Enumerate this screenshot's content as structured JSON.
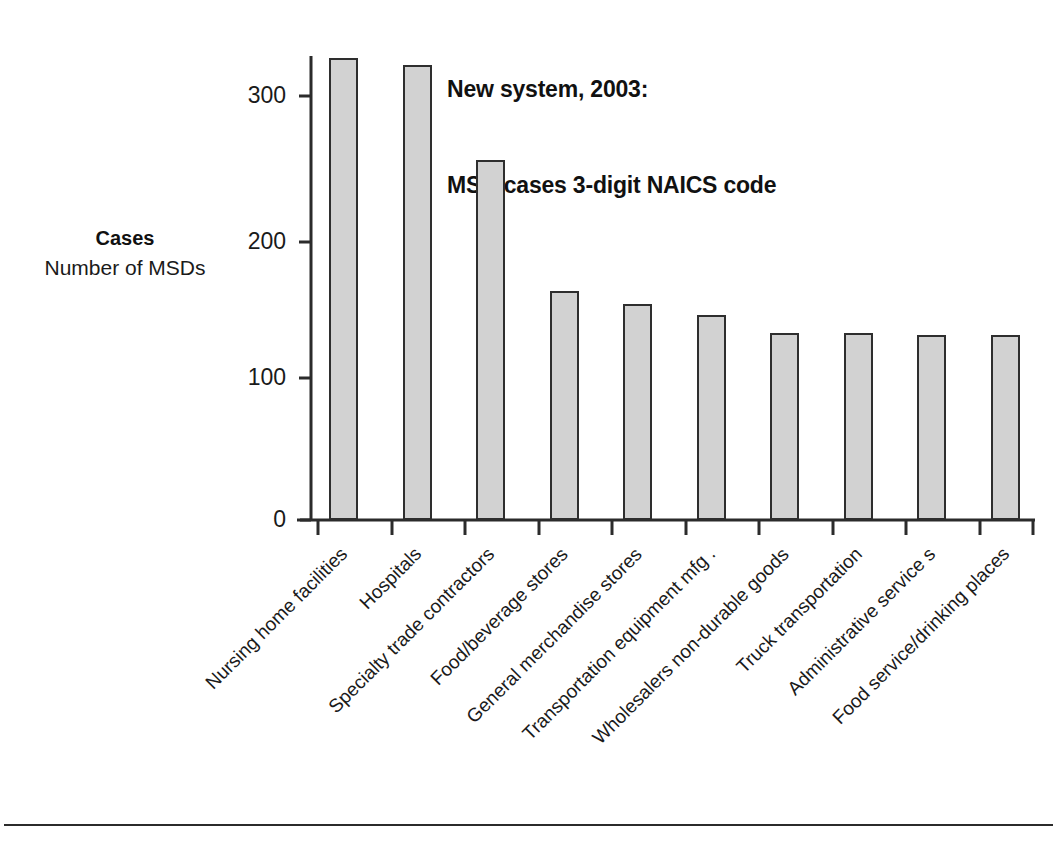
{
  "chart_data": {
    "type": "bar",
    "title": "New system, 2003: MSD cases 3-digit NAICS code",
    "title_lines": [
      "New system, 2003:",
      "MSD cases 3-digit NAICS code"
    ],
    "xlabel": "",
    "ylabel": "Cases Number of MSDs",
    "ylabel_lines": [
      "Cases",
      "Number of MSDs"
    ],
    "ylim": [
      0,
      340
    ],
    "yticks": [
      0,
      100,
      200,
      300
    ],
    "ytick_labels": [
      "0",
      "100",
      "200",
      "300"
    ],
    "grid": false,
    "legend": false,
    "bar_color": "#d2d2d2",
    "bar_edge_color": "#2e2e2e",
    "categories": [
      "Nursing home facilities",
      "Hospitals",
      "Specialty trade contractors",
      "Food/beverage stores",
      "General merchandise stores",
      "Transportation equipment mfg .",
      "Wholesalers non-durable goods",
      "Truck transportation",
      "Administrative service s",
      "Food service/drinking places"
    ],
    "values": [
      327,
      322,
      255,
      162,
      153,
      145,
      132,
      132,
      131,
      131
    ]
  }
}
